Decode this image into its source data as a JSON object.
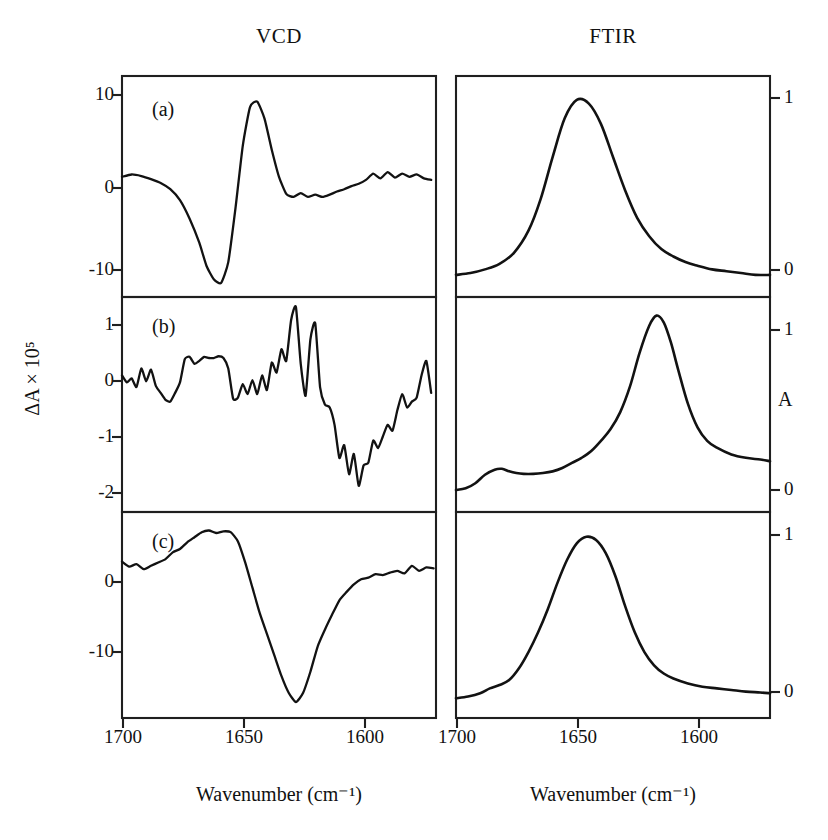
{
  "figure": {
    "columns": [
      {
        "id": "vcd",
        "title": "VCD"
      },
      {
        "id": "ftir",
        "title": "FTIR"
      }
    ],
    "axis_labels": {
      "x_left": "Wavenumber (cm⁻¹)",
      "x_right": "Wavenumber (cm⁻¹)",
      "y_left": "ΔA × 10⁵",
      "y_right": "A"
    },
    "panel_letters": [
      "(a)",
      "(b)",
      "(c)"
    ],
    "colors": {
      "ink": "#121212",
      "frame": "#1f1f1f",
      "background": "#ffffff"
    }
  },
  "chart_data": [
    {
      "type": "line",
      "panel": "(a)",
      "column": "VCD",
      "title": "VCD",
      "xlabel": "Wavenumber (cm⁻¹)",
      "ylabel": "ΔA × 10⁵",
      "xlim": [
        1700,
        1570
      ],
      "ylim": [
        -15.5,
        13.0
      ],
      "xticks": [
        1700,
        1650,
        1600
      ],
      "xticklabels": [
        "1700",
        "1650",
        "1600"
      ],
      "yticks": [
        10,
        0,
        -10
      ],
      "yticklabels": [
        "10",
        "0",
        "-10"
      ],
      "grid": false,
      "legend": "none",
      "x": [
        1700,
        1696,
        1692,
        1688,
        1684,
        1680,
        1676,
        1672,
        1668,
        1665,
        1662,
        1659,
        1656,
        1653,
        1650,
        1647,
        1644,
        1641,
        1638,
        1635,
        1632,
        1629,
        1626,
        1623,
        1620,
        1617,
        1614,
        1611,
        1608,
        1605,
        1602,
        1599,
        1596,
        1593,
        1590,
        1587,
        1584,
        1581,
        1578,
        1575,
        1572
      ],
      "y": [
        0.0,
        0.3,
        0.1,
        -0.3,
        -0.8,
        -1.6,
        -3.0,
        -5.4,
        -8.5,
        -11.5,
        -13.2,
        -13.7,
        -11.0,
        -4.0,
        4.0,
        9.0,
        9.7,
        7.5,
        3.5,
        0.0,
        -2.2,
        -2.6,
        -2.1,
        -2.6,
        -2.3,
        -2.6,
        -2.3,
        -1.9,
        -1.6,
        -1.2,
        -0.9,
        -0.4,
        0.4,
        -0.2,
        0.6,
        -0.1,
        0.4,
        0.0,
        0.3,
        -0.2,
        -0.4
      ]
    },
    {
      "type": "line",
      "panel": "(a)",
      "column": "FTIR",
      "title": "FTIR",
      "xlabel": "Wavenumber (cm⁻¹)",
      "ylabel": "A",
      "xlim": [
        1700,
        1570
      ],
      "ylim": [
        -0.08,
        1.12
      ],
      "xticks": [
        1700,
        1650,
        1600
      ],
      "xticklabels": [
        "1700",
        "1650",
        "1600"
      ],
      "yticks": [
        1,
        0
      ],
      "yticklabels": [
        "1",
        "0"
      ],
      "grid": false,
      "legend": "none",
      "x": [
        1700,
        1694,
        1688,
        1682,
        1676,
        1670,
        1665,
        1660,
        1655,
        1650,
        1645,
        1640,
        1635,
        1630,
        1625,
        1620,
        1615,
        1610,
        1605,
        1600,
        1594,
        1588,
        1582,
        1576,
        1570
      ],
      "y": [
        0.04,
        0.05,
        0.07,
        0.1,
        0.16,
        0.28,
        0.45,
        0.68,
        0.89,
        0.99,
        0.97,
        0.86,
        0.68,
        0.5,
        0.35,
        0.25,
        0.18,
        0.14,
        0.11,
        0.09,
        0.07,
        0.06,
        0.05,
        0.04,
        0.04
      ]
    },
    {
      "type": "line",
      "panel": "(b)",
      "column": "VCD",
      "title": "VCD",
      "xlabel": "Wavenumber (cm⁻¹)",
      "ylabel": "ΔA × 10⁵",
      "xlim": [
        1700,
        1570
      ],
      "ylim": [
        -2.35,
        1.35
      ],
      "xticks": [
        1700,
        1650,
        1600
      ],
      "xticklabels": [
        "1700",
        "1650",
        "1600"
      ],
      "yticks": [
        1,
        0,
        -1,
        -2
      ],
      "yticklabels": [
        "1",
        "0",
        "-1",
        "-2"
      ],
      "grid": false,
      "legend": "none",
      "x": [
        1700,
        1698,
        1696,
        1694,
        1692,
        1690,
        1688,
        1686,
        1684,
        1682,
        1680,
        1678,
        1676,
        1674,
        1672,
        1670,
        1668,
        1666,
        1664,
        1662,
        1660,
        1658,
        1656,
        1654,
        1652,
        1650,
        1648,
        1646,
        1644,
        1642,
        1640,
        1638,
        1636,
        1634,
        1632,
        1630,
        1628,
        1626,
        1624,
        1622,
        1620,
        1618,
        1616,
        1614,
        1612,
        1610,
        1608,
        1606,
        1604,
        1602,
        1600,
        1598,
        1596,
        1594,
        1592,
        1590,
        1588,
        1586,
        1584,
        1582,
        1580,
        1578,
        1576,
        1574,
        1572
      ],
      "y": [
        0.0,
        -0.12,
        -0.05,
        -0.2,
        0.12,
        -0.1,
        0.1,
        -0.18,
        -0.3,
        -0.42,
        -0.45,
        -0.3,
        -0.12,
        0.28,
        0.32,
        0.2,
        0.25,
        0.32,
        0.3,
        0.3,
        0.33,
        0.3,
        0.12,
        -0.4,
        -0.38,
        -0.15,
        -0.32,
        -0.08,
        -0.32,
        0.0,
        -0.25,
        0.22,
        0.05,
        0.45,
        0.25,
        0.95,
        1.18,
        0.2,
        -0.35,
        0.62,
        0.9,
        -0.2,
        -0.5,
        -0.55,
        -0.85,
        -1.42,
        -1.2,
        -1.7,
        -1.35,
        -1.9,
        -1.55,
        -1.5,
        -1.12,
        -1.25,
        -1.05,
        -0.85,
        -0.95,
        -0.6,
        -0.32,
        -0.55,
        -0.45,
        -0.38,
        0.0,
        0.25,
        -0.3
      ]
    },
    {
      "type": "line",
      "panel": "(b)",
      "column": "FTIR",
      "title": "FTIR",
      "xlabel": "Wavenumber (cm⁻¹)",
      "ylabel": "A",
      "xlim": [
        1700,
        1570
      ],
      "ylim": [
        -0.12,
        1.15
      ],
      "xticks": [
        1700,
        1650,
        1600
      ],
      "xticklabels": [
        "1700",
        "1650",
        "1600"
      ],
      "yticks": [
        1,
        0
      ],
      "yticklabels": [
        "1",
        "0"
      ],
      "grid": false,
      "legend": "none",
      "x": [
        1700,
        1696,
        1692,
        1688,
        1684,
        1681,
        1678,
        1675,
        1672,
        1668,
        1664,
        1660,
        1656,
        1652,
        1648,
        1644,
        1640,
        1636,
        1632,
        1628,
        1624,
        1620,
        1617,
        1614,
        1611,
        1608,
        1604,
        1600,
        1596,
        1592,
        1586,
        1580,
        1574,
        1570
      ],
      "y": [
        0.01,
        0.02,
        0.05,
        0.1,
        0.13,
        0.135,
        0.12,
        0.11,
        0.105,
        0.105,
        0.11,
        0.12,
        0.14,
        0.17,
        0.2,
        0.24,
        0.3,
        0.37,
        0.47,
        0.62,
        0.82,
        0.98,
        1.04,
        1.0,
        0.88,
        0.72,
        0.52,
        0.38,
        0.3,
        0.26,
        0.22,
        0.2,
        0.19,
        0.18
      ]
    },
    {
      "type": "line",
      "panel": "(c)",
      "column": "VCD",
      "title": "VCD",
      "xlabel": "Wavenumber (cm⁻¹)",
      "ylabel": "ΔA × 10⁵",
      "xlim": [
        1700,
        1570
      ],
      "ylim": [
        -18.5,
        6.0
      ],
      "xticks": [
        1700,
        1650,
        1600
      ],
      "xticklabels": [
        "1700",
        "1650",
        "1600"
      ],
      "yticks": [
        0,
        -10
      ],
      "yticklabels": [
        "0",
        "-10"
      ],
      "grid": false,
      "legend": "none",
      "x": [
        1700,
        1697,
        1694,
        1691,
        1688,
        1685,
        1682,
        1679,
        1676,
        1673,
        1670,
        1667,
        1664,
        1661,
        1658,
        1655,
        1652,
        1649,
        1646,
        1643,
        1640,
        1637,
        1634,
        1631,
        1628,
        1625,
        1622,
        1619,
        1616,
        1613,
        1610,
        1607,
        1604,
        1601,
        1598,
        1595,
        1592,
        1589,
        1586,
        1583,
        1580,
        1577,
        1574,
        1571
      ],
      "y": [
        0.1,
        -0.5,
        -0.2,
        -0.8,
        -0.4,
        0.0,
        0.4,
        1.2,
        1.6,
        2.4,
        3.0,
        3.6,
        3.8,
        3.5,
        3.7,
        3.6,
        2.5,
        0.0,
        -3.0,
        -6.0,
        -8.5,
        -11.0,
        -13.5,
        -15.5,
        -16.6,
        -15.5,
        -13.0,
        -10.0,
        -8.0,
        -6.2,
        -4.5,
        -3.5,
        -2.6,
        -2.0,
        -1.8,
        -1.4,
        -1.5,
        -1.2,
        -1.0,
        -1.3,
        -0.4,
        -1.0,
        -0.6,
        -0.7
      ]
    },
    {
      "type": "line",
      "panel": "(c)",
      "column": "FTIR",
      "title": "FTIR",
      "xlabel": "Wavenumber (cm⁻¹)",
      "ylabel": "A",
      "xlim": [
        1700,
        1570
      ],
      "ylim": [
        -0.1,
        1.15
      ],
      "xticks": [
        1700,
        1650,
        1600
      ],
      "xticklabels": [
        "1700",
        "1650",
        "1600"
      ],
      "yticks": [
        1,
        0
      ],
      "yticklabels": [
        "1",
        "0"
      ],
      "grid": false,
      "legend": "none",
      "x": [
        1700,
        1695,
        1690,
        1686,
        1682,
        1678,
        1674,
        1670,
        1666,
        1662,
        1658,
        1654,
        1650,
        1646,
        1642,
        1638,
        1634,
        1630,
        1626,
        1622,
        1618,
        1614,
        1610,
        1604,
        1598,
        1592,
        1586,
        1580,
        1574,
        1570
      ],
      "y": [
        0.02,
        0.03,
        0.05,
        0.08,
        0.1,
        0.13,
        0.2,
        0.3,
        0.42,
        0.56,
        0.72,
        0.86,
        0.96,
        1.0,
        0.98,
        0.9,
        0.76,
        0.58,
        0.42,
        0.3,
        0.22,
        0.17,
        0.14,
        0.11,
        0.09,
        0.08,
        0.07,
        0.06,
        0.055,
        0.05
      ]
    }
  ],
  "ticks": {
    "left_a": [
      "10",
      "0",
      "-10"
    ],
    "left_b": [
      "1",
      "0",
      "-1",
      "-2"
    ],
    "left_c": [
      "0",
      "-10"
    ],
    "right_a": [
      "1",
      "0"
    ],
    "right_b": [
      "1",
      "0"
    ],
    "right_c": [
      "1",
      "0"
    ],
    "x_left": [
      "1700",
      "1650",
      "1600"
    ],
    "x_right": [
      "1700",
      "1650",
      "1600"
    ]
  }
}
